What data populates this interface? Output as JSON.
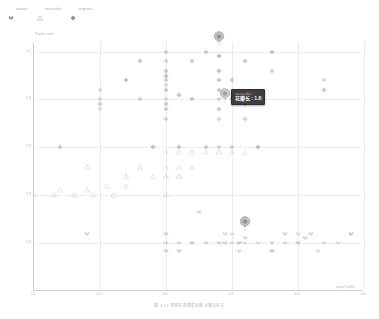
{
  "legend": {
    "items": [
      {
        "label": "setosa",
        "glyph": "club-icon",
        "color": "#b9b9c9"
      },
      {
        "label": "versicolor",
        "glyph": "triangle-icon",
        "color": "#c2c2c2"
      },
      {
        "label": "virginica",
        "glyph": "diamond-icon",
        "color": "#a9a9b8"
      }
    ]
  },
  "tooltip": {
    "title": "versicolor",
    "value": "花瓣长 : 1.8"
  },
  "caption": "图 3-12  鸢尾花数据集的散点图及标注",
  "chart_data": {
    "type": "scatter",
    "title": "",
    "xlabel": "sepal width",
    "ylabel": "Petal truth",
    "xlim": [
      2.0,
      4.5
    ],
    "ylim": [
      0.0,
      2.6
    ],
    "xticks": [
      2.0,
      2.5,
      3.0,
      3.5,
      4.0,
      4.5
    ],
    "yticks": [
      0.5,
      1.0,
      1.5,
      2.0,
      2.5
    ],
    "grid": true,
    "legend_position": "top-left",
    "annotations": [
      {
        "name": "pin-top",
        "x": 3.4,
        "y": 2.55,
        "label": ""
      },
      {
        "name": "pin-hover",
        "x": 3.45,
        "y": 1.95,
        "label": "versicolor"
      },
      {
        "name": "pin-bottom",
        "x": 3.6,
        "y": 0.62,
        "label": ""
      }
    ],
    "series": [
      {
        "name": "virginica",
        "marker": "diamond",
        "color": "#b6b6c6",
        "points": [
          [
            3.0,
            2.5
          ],
          [
            3.3,
            2.5
          ],
          [
            3.8,
            2.5
          ],
          [
            3.0,
            2.4
          ],
          [
            3.2,
            2.4
          ],
          [
            3.6,
            2.4
          ],
          [
            2.8,
            2.4
          ],
          [
            3.4,
            2.45
          ],
          [
            3.0,
            2.3
          ],
          [
            3.4,
            2.3
          ],
          [
            3.0,
            2.25
          ],
          [
            3.8,
            2.3
          ],
          [
            2.7,
            2.2
          ],
          [
            3.0,
            2.2
          ],
          [
            3.4,
            2.2
          ],
          [
            3.5,
            2.2
          ],
          [
            3.0,
            2.15
          ],
          [
            4.2,
            2.2
          ],
          [
            2.5,
            2.1
          ],
          [
            3.0,
            2.1
          ],
          [
            3.4,
            2.1
          ],
          [
            3.1,
            2.05
          ],
          [
            4.2,
            2.1
          ],
          [
            2.5,
            2.0
          ],
          [
            2.8,
            2.0
          ],
          [
            3.0,
            2.0
          ],
          [
            3.2,
            2.0
          ],
          [
            3.4,
            2.0
          ],
          [
            3.5,
            2.0
          ],
          [
            2.5,
            1.95
          ],
          [
            3.0,
            1.95
          ],
          [
            3.6,
            1.95
          ],
          [
            2.5,
            1.9
          ],
          [
            3.0,
            1.9
          ],
          [
            3.4,
            1.9
          ],
          [
            3.0,
            1.8
          ],
          [
            3.4,
            1.8
          ],
          [
            3.6,
            1.8
          ],
          [
            2.2,
            1.5
          ],
          [
            2.9,
            1.5
          ],
          [
            3.1,
            1.5
          ],
          [
            3.3,
            1.5
          ],
          [
            3.4,
            1.5
          ],
          [
            3.5,
            1.5
          ],
          [
            3.7,
            1.5
          ]
        ]
      },
      {
        "name": "versicolor",
        "marker": "triangle",
        "color": "#cccccc",
        "points": [
          [
            3.0,
            1.45
          ],
          [
            3.1,
            1.45
          ],
          [
            3.2,
            1.45
          ],
          [
            3.3,
            1.45
          ],
          [
            3.4,
            1.45
          ],
          [
            3.5,
            1.45
          ],
          [
            3.6,
            1.45
          ],
          [
            2.4,
            1.3
          ],
          [
            2.8,
            1.3
          ],
          [
            3.0,
            1.3
          ],
          [
            3.1,
            1.3
          ],
          [
            3.2,
            1.3
          ],
          [
            2.7,
            1.2
          ],
          [
            2.9,
            1.2
          ],
          [
            3.0,
            1.2
          ],
          [
            3.1,
            1.2
          ],
          [
            2.55,
            1.1
          ],
          [
            2.7,
            1.1
          ],
          [
            2.2,
            1.05
          ],
          [
            2.4,
            1.05
          ],
          [
            2.0,
            1.0
          ],
          [
            2.15,
            1.0
          ],
          [
            2.3,
            1.0
          ],
          [
            2.45,
            1.0
          ],
          [
            2.6,
            1.0
          ],
          [
            3.0,
            1.0
          ]
        ]
      },
      {
        "name": "setosa",
        "marker": "club",
        "color": "#c5c5c5",
        "points": [
          [
            3.25,
            0.82
          ],
          [
            2.4,
            0.6
          ],
          [
            3.0,
            0.6
          ],
          [
            3.45,
            0.6
          ],
          [
            3.5,
            0.6
          ],
          [
            3.9,
            0.6
          ],
          [
            4.0,
            0.6
          ],
          [
            4.1,
            0.6
          ],
          [
            4.4,
            0.6
          ],
          [
            3.6,
            0.55
          ],
          [
            4.05,
            0.55
          ],
          [
            3.0,
            0.5
          ],
          [
            3.1,
            0.5
          ],
          [
            3.2,
            0.5
          ],
          [
            3.3,
            0.5
          ],
          [
            3.4,
            0.5
          ],
          [
            3.45,
            0.5
          ],
          [
            3.5,
            0.5
          ],
          [
            3.55,
            0.5
          ],
          [
            3.6,
            0.5
          ],
          [
            3.7,
            0.5
          ],
          [
            3.8,
            0.5
          ],
          [
            3.9,
            0.5
          ],
          [
            4.0,
            0.5
          ],
          [
            4.2,
            0.5
          ],
          [
            4.3,
            0.5
          ],
          [
            3.0,
            0.42
          ],
          [
            3.1,
            0.42
          ],
          [
            3.55,
            0.42
          ],
          [
            3.8,
            0.42
          ],
          [
            4.15,
            0.42
          ]
        ]
      }
    ]
  }
}
